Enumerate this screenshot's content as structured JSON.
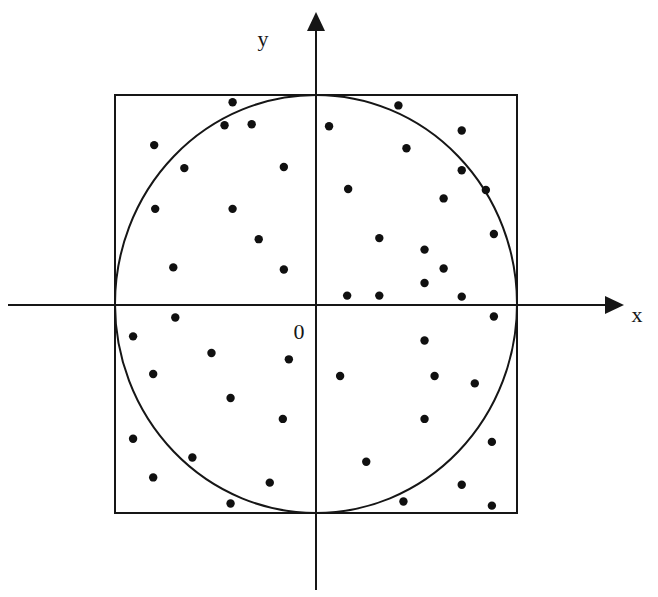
{
  "figure": {
    "background_color": "#ffffff",
    "stroke_color": "#161616",
    "point_color": "#101010"
  },
  "labels": {
    "x_axis": "x",
    "y_axis": "y",
    "origin": "0"
  },
  "chart_data": {
    "type": "scatter",
    "title": "",
    "subtitle": "",
    "xlabel": "x",
    "ylabel": "y",
    "origin_label": "0",
    "grid": false,
    "legend": "none",
    "axis_style": "arrowed-cartesian-axes",
    "xlim": [
      -1.48,
      1.48
    ],
    "ylim": [
      -1.42,
      1.42
    ],
    "shapes": [
      {
        "name": "bounding-square",
        "type": "rect",
        "x_min": -1.0,
        "x_max": 1.0,
        "y_min": -1.0,
        "y_max": 1.0,
        "fill": "none",
        "stroke": "#161616"
      },
      {
        "name": "inscribed-circle",
        "type": "circle",
        "cx": 0.0,
        "cy": 0.0,
        "r": 1.0,
        "fill": "none",
        "stroke": "#161616"
      }
    ],
    "point_count": 50,
    "points_inside_circle": 39,
    "points_outside_circle": 11,
    "point_radius_px": 4.2,
    "points": [
      {
        "x": -0.415,
        "y": 0.97,
        "inside": true
      },
      {
        "x": -0.455,
        "y": 0.86,
        "inside": true
      },
      {
        "x": -0.32,
        "y": 0.865,
        "inside": true
      },
      {
        "x": -0.805,
        "y": 0.765,
        "inside": true
      },
      {
        "x": -0.16,
        "y": 0.66,
        "inside": true
      },
      {
        "x": -0.8,
        "y": 0.46,
        "inside": true
      },
      {
        "x": -0.415,
        "y": 0.46,
        "inside": true
      },
      {
        "x": -0.285,
        "y": 0.315,
        "inside": true
      },
      {
        "x": -0.71,
        "y": 0.18,
        "inside": true
      },
      {
        "x": -0.16,
        "y": 0.17,
        "inside": true
      },
      {
        "x": 0.41,
        "y": 0.955,
        "inside": true
      },
      {
        "x": 0.065,
        "y": 0.855,
        "inside": true
      },
      {
        "x": 0.725,
        "y": 0.835,
        "inside": true
      },
      {
        "x": 0.45,
        "y": 0.75,
        "inside": true
      },
      {
        "x": 0.725,
        "y": 0.645,
        "inside": true
      },
      {
        "x": 0.16,
        "y": 0.555,
        "inside": true
      },
      {
        "x": 0.635,
        "y": 0.51,
        "inside": true
      },
      {
        "x": 0.315,
        "y": 0.32,
        "inside": true
      },
      {
        "x": 0.885,
        "y": 0.34,
        "inside": false
      },
      {
        "x": 0.54,
        "y": 0.265,
        "inside": true
      },
      {
        "x": 0.54,
        "y": 0.105,
        "inside": true
      },
      {
        "x": 0.155,
        "y": 0.045,
        "inside": true
      },
      {
        "x": 0.315,
        "y": 0.045,
        "inside": true
      },
      {
        "x": 0.725,
        "y": 0.04,
        "inside": true
      },
      {
        "x": -0.91,
        "y": -0.15,
        "inside": false
      },
      {
        "x": -0.52,
        "y": -0.23,
        "inside": true
      },
      {
        "x": -0.135,
        "y": -0.26,
        "inside": true
      },
      {
        "x": -0.81,
        "y": -0.33,
        "inside": true
      },
      {
        "x": -0.425,
        "y": -0.445,
        "inside": true
      },
      {
        "x": -0.165,
        "y": -0.545,
        "inside": true
      },
      {
        "x": -0.91,
        "y": -0.64,
        "inside": false
      },
      {
        "x": -0.615,
        "y": -0.73,
        "inside": true
      },
      {
        "x": -0.81,
        "y": -0.825,
        "inside": false
      },
      {
        "x": -0.23,
        "y": -0.85,
        "inside": true
      },
      {
        "x": -0.425,
        "y": -0.95,
        "inside": false
      },
      {
        "x": 0.54,
        "y": -0.17,
        "inside": true
      },
      {
        "x": 0.12,
        "y": -0.34,
        "inside": true
      },
      {
        "x": 0.59,
        "y": -0.34,
        "inside": true
      },
      {
        "x": 0.79,
        "y": -0.375,
        "inside": true
      },
      {
        "x": 0.54,
        "y": -0.545,
        "inside": true
      },
      {
        "x": 0.875,
        "y": -0.655,
        "inside": false
      },
      {
        "x": 0.25,
        "y": -0.75,
        "inside": true
      },
      {
        "x": 0.725,
        "y": -0.86,
        "inside": false
      },
      {
        "x": 0.435,
        "y": -0.94,
        "inside": false
      },
      {
        "x": 0.875,
        "y": -0.96,
        "inside": false
      },
      {
        "x": 0.845,
        "y": 0.55,
        "inside": false
      },
      {
        "x": 0.885,
        "y": -0.055,
        "inside": true
      },
      {
        "x": -0.655,
        "y": 0.655,
        "inside": true
      },
      {
        "x": -0.7,
        "y": -0.06,
        "inside": true
      },
      {
        "x": 0.635,
        "y": 0.175,
        "inside": true
      }
    ]
  },
  "geometry_px": {
    "origin": {
      "x": 316,
      "y": 305
    },
    "scale_px_per_unit": 201,
    "square": {
      "left": 115,
      "top": 95,
      "right": 517,
      "bottom": 513
    },
    "circle": {
      "cx": 316,
      "cy": 305,
      "r": 201
    },
    "x_axis": {
      "x1": 8,
      "y1": 305,
      "x2": 612,
      "y2": 305
    },
    "y_axis": {
      "x1": 316,
      "y1": 20,
      "x2": 316,
      "y2": 590
    },
    "x_label_pos": {
      "x": 637,
      "y": 322
    },
    "y_label_pos": {
      "x": 263,
      "y": 45
    },
    "origin_label_pos": {
      "x": 299,
      "y": 338
    }
  }
}
